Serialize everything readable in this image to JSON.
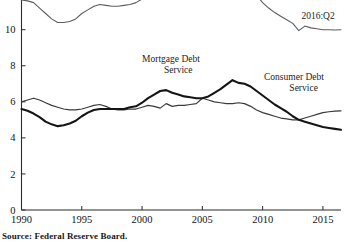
{
  "source_note": "Source: Federal Reserve Board.",
  "labels": {
    "total": "Service",
    "mortgage_line1": "Mortgage Debt",
    "mortgage_line2": "Service",
    "consumer_line1": "Consumer Debt",
    "consumer_line2": "Service",
    "endpoint": "2016:Q2"
  },
  "colors": {
    "total": "#5d5d5d",
    "consumer": "#3a3a3a",
    "mortgage": "#151515",
    "axis": "#2b2b2b",
    "background": "#ffffff"
  },
  "chart_data": {
    "type": "line",
    "title": "",
    "subtitle": "",
    "xlabel": "",
    "ylabel": "",
    "xlim": [
      1990,
      2016.5
    ],
    "ylim": [
      0,
      13.2
    ],
    "grid": false,
    "legend_position": "inline-annotations",
    "xticks": [
      1990,
      1995,
      2000,
      2005,
      2010,
      2015
    ],
    "xtick_labels": [
      "1990",
      "1995",
      "2000",
      "2005",
      "2010",
      "2015"
    ],
    "yticks": [
      0,
      2,
      4,
      6,
      8,
      10,
      12
    ],
    "ytick_labels": [
      "0",
      "2",
      "4",
      "6",
      "8",
      "10",
      "12"
    ],
    "annotations": [
      {
        "text": "2016:Q2",
        "x": 2014.6,
        "y": 10.6
      },
      {
        "text": "Service",
        "x": 1997.8,
        "y": 12.9
      },
      {
        "text": "Mortgage Debt",
        "x": 2002.4,
        "y": 8.2
      },
      {
        "text": "Service",
        "x": 2003.0,
        "y": 7.6
      },
      {
        "text": "Consumer Debt",
        "x": 2012.6,
        "y": 7.2
      },
      {
        "text": "Service",
        "x": 2013.4,
        "y": 6.6
      }
    ],
    "series": [
      {
        "name": "Total Debt Service",
        "style": "thin-gray",
        "x": [
          1990.0,
          1990.5,
          1991.0,
          1991.5,
          1992.0,
          1992.5,
          1993.0,
          1993.5,
          1994.0,
          1994.5,
          1995.0,
          1995.5,
          1996.0,
          1996.5,
          1997.0,
          1997.5,
          1998.0,
          1998.5,
          1999.0,
          1999.5,
          2000.0,
          2000.5,
          2001.0,
          2001.5,
          2002.0,
          2002.5,
          2003.0,
          2003.5,
          2004.0,
          2004.5,
          2005.0,
          2005.5,
          2006.0,
          2006.5,
          2007.0,
          2007.5,
          2008.0,
          2008.5,
          2009.0,
          2009.5,
          2010.0,
          2010.5,
          2011.0,
          2011.5,
          2012.0,
          2012.5,
          2013.0,
          2013.5,
          2014.0,
          2014.5,
          2015.0,
          2015.5,
          2016.0,
          2016.5
        ],
        "y": [
          11.65,
          11.6,
          11.5,
          11.2,
          10.9,
          10.6,
          10.4,
          10.4,
          10.45,
          10.6,
          10.9,
          11.1,
          11.3,
          11.4,
          11.35,
          11.3,
          11.3,
          11.35,
          11.4,
          11.5,
          11.7,
          11.9,
          12.05,
          12.15,
          12.45,
          12.25,
          12.3,
          12.3,
          12.35,
          12.55,
          12.7,
          12.85,
          13.0,
          13.1,
          13.15,
          13.1,
          13.1,
          12.85,
          12.4,
          11.9,
          11.5,
          11.2,
          10.95,
          10.75,
          10.55,
          10.35,
          9.95,
          10.2,
          10.1,
          10.05,
          10.0,
          10.0,
          9.98,
          10.0
        ]
      },
      {
        "name": "Consumer Debt Service",
        "style": "thin-dark",
        "x": [
          1990.0,
          1990.5,
          1991.0,
          1991.5,
          1992.0,
          1992.5,
          1993.0,
          1993.5,
          1994.0,
          1994.5,
          1995.0,
          1995.5,
          1996.0,
          1996.5,
          1997.0,
          1997.5,
          1998.0,
          1998.5,
          1999.0,
          1999.5,
          2000.0,
          2000.5,
          2001.0,
          2001.5,
          2002.0,
          2002.5,
          2003.0,
          2003.5,
          2004.0,
          2004.5,
          2005.0,
          2005.5,
          2006.0,
          2006.5,
          2007.0,
          2007.5,
          2008.0,
          2008.5,
          2009.0,
          2009.5,
          2010.0,
          2010.5,
          2011.0,
          2011.5,
          2012.0,
          2012.5,
          2013.0,
          2013.5,
          2014.0,
          2014.5,
          2015.0,
          2015.5,
          2016.0,
          2016.5
        ],
        "y": [
          6.0,
          6.1,
          6.2,
          6.1,
          5.95,
          5.8,
          5.7,
          5.6,
          5.55,
          5.55,
          5.6,
          5.7,
          5.8,
          5.85,
          5.75,
          5.6,
          5.55,
          5.55,
          5.6,
          5.6,
          5.7,
          5.8,
          5.75,
          5.65,
          5.9,
          5.75,
          5.8,
          5.8,
          5.85,
          5.9,
          6.2,
          6.1,
          6.0,
          5.95,
          5.9,
          5.9,
          5.95,
          5.9,
          5.75,
          5.55,
          5.4,
          5.3,
          5.2,
          5.1,
          5.05,
          5.0,
          5.0,
          5.1,
          5.2,
          5.3,
          5.4,
          5.45,
          5.48,
          5.5
        ]
      },
      {
        "name": "Mortgage Debt Service",
        "style": "thick",
        "x": [
          1990.0,
          1990.5,
          1991.0,
          1991.5,
          1992.0,
          1992.5,
          1993.0,
          1993.5,
          1994.0,
          1994.5,
          1995.0,
          1995.5,
          1996.0,
          1996.5,
          1997.0,
          1997.5,
          1998.0,
          1998.5,
          1999.0,
          1999.5,
          2000.0,
          2000.5,
          2001.0,
          2001.5,
          2002.0,
          2002.5,
          2003.0,
          2003.5,
          2004.0,
          2004.5,
          2005.0,
          2005.5,
          2006.0,
          2006.5,
          2007.0,
          2007.5,
          2008.0,
          2008.5,
          2009.0,
          2009.5,
          2010.0,
          2010.5,
          2011.0,
          2011.5,
          2012.0,
          2012.5,
          2013.0,
          2013.5,
          2014.0,
          2014.5,
          2015.0,
          2015.5,
          2016.0,
          2016.5
        ],
        "y": [
          5.6,
          5.5,
          5.35,
          5.15,
          4.9,
          4.75,
          4.65,
          4.7,
          4.8,
          4.95,
          5.2,
          5.4,
          5.55,
          5.6,
          5.6,
          5.6,
          5.6,
          5.6,
          5.7,
          5.75,
          5.95,
          6.2,
          6.4,
          6.6,
          6.65,
          6.5,
          6.4,
          6.3,
          6.25,
          6.2,
          6.2,
          6.3,
          6.5,
          6.7,
          6.95,
          7.2,
          7.05,
          7.0,
          6.85,
          6.6,
          6.35,
          6.1,
          5.85,
          5.65,
          5.45,
          5.2,
          5.0,
          4.9,
          4.8,
          4.7,
          4.6,
          4.55,
          4.5,
          4.45
        ]
      }
    ]
  }
}
